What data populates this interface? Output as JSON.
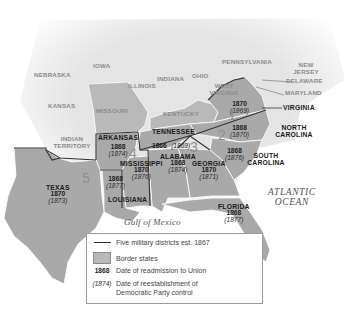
{
  "map": {
    "title": "Reconstruction Military Districts",
    "colors": {
      "background": "#ffffff",
      "land_north": "#e6e6e6",
      "border_states": "#b9b9b9",
      "confederate_states": "#a9a9a9",
      "district_line": "#333333"
    },
    "northern_states": [
      {
        "name": "NEBRASKA"
      },
      {
        "name": "IOWA"
      },
      {
        "name": "ILLINOIS"
      },
      {
        "name": "INDIANA"
      },
      {
        "name": "OHIO"
      },
      {
        "name": "PENNSYLVANIA"
      },
      {
        "name": "NEW JERSEY"
      },
      {
        "name": "DELAWARE"
      },
      {
        "name": "MARYLAND"
      },
      {
        "name": "KANSAS"
      },
      {
        "name": "WEST VIRGINIA"
      },
      {
        "name": "INDIAN TERRITORY"
      }
    ],
    "border_states": [
      {
        "name": "MISSOURI"
      },
      {
        "name": "KENTUCKY"
      }
    ],
    "southern_states": [
      {
        "name": "VIRGINIA",
        "readmitted": "1870",
        "democratic_control": "(1869)"
      },
      {
        "name": "NORTH CAROLINA",
        "readmitted": "1868",
        "democratic_control": "(1870)"
      },
      {
        "name": "SOUTH CAROLINA",
        "readmitted": "1868",
        "democratic_control": "(1876)"
      },
      {
        "name": "TENNESSEE",
        "readmitted": "1866",
        "democratic_control": "(1869)"
      },
      {
        "name": "GEORGIA",
        "readmitted": "1870",
        "democratic_control": "(1871)"
      },
      {
        "name": "ALABAMA",
        "readmitted": "1868",
        "democratic_control": "(1874)"
      },
      {
        "name": "FLORIDA",
        "readmitted": "1868",
        "democratic_control": "(1877)"
      },
      {
        "name": "MISSISSIPPI",
        "readmitted": "1870",
        "democratic_control": "(1876)"
      },
      {
        "name": "ARKANSAS",
        "readmitted": "1868",
        "democratic_control": "(1874)"
      },
      {
        "name": "LOUISIANA",
        "readmitted": "1868",
        "democratic_control": "(1877)"
      },
      {
        "name": "TEXAS",
        "readmitted": "1870",
        "democratic_control": "(1873)"
      }
    ],
    "districts": [
      "1",
      "2",
      "3",
      "4",
      "5"
    ],
    "water_bodies": {
      "atlantic_line1": "ATLANTIC",
      "atlantic_line2": "OCEAN",
      "gulf": "Gulf of Mexico"
    }
  },
  "legend": {
    "items": [
      {
        "key_type": "line",
        "key": "",
        "label": "Five military districts est. 1867"
      },
      {
        "key_type": "box",
        "key": "",
        "label": "Border states"
      },
      {
        "key_type": "bold-year",
        "key": "1868",
        "label": "Date of readmission to Union"
      },
      {
        "key_type": "italic-year",
        "key": "(1874)",
        "label": "Date of reestablishment of",
        "label2": "Democratic Party control"
      }
    ]
  }
}
